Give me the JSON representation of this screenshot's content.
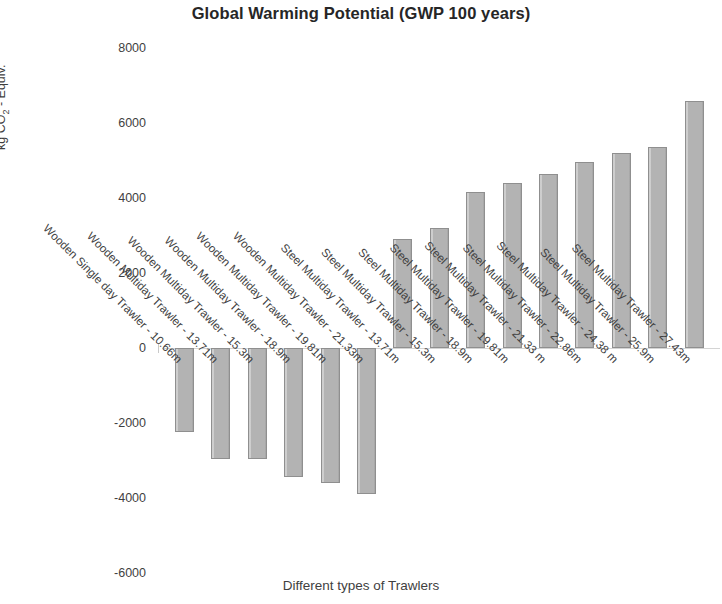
{
  "chart_data": {
    "type": "bar",
    "title": "Global Warming Potential (GWP 100 years)",
    "xlabel": "Different types of Trawlers",
    "ylabel": "kg CO2 - Equiv.",
    "ylabel_prefix": "kg CO",
    "ylabel_subscript": "2",
    "ylabel_suffix": " - Equiv.",
    "ylim": [
      -6000,
      8000
    ],
    "yticks": [
      8000,
      6000,
      4000,
      2000,
      0,
      -2000,
      -4000,
      -6000
    ],
    "ytick_labels": [
      "8000",
      "6000",
      "4000",
      "2000",
      "0",
      "-2000",
      "-4000",
      "-6000"
    ],
    "grid": false,
    "legend": "none",
    "bar_color": "#b3b3b3",
    "bar_edge_color": "#8f8f8f",
    "categories": [
      "Wooden Single day Trawler - 10.66m",
      "Wooden Multiday Trawler - 13.71m",
      "Wooden Multiday Trawler - 15.3m",
      "Wooden Multiday Trawler - 18.9m",
      "Wooden Multiday Trawler - 19.81m",
      "Wooden Multiday Trawler - 21.33m",
      "Steel Multiday Trawler - 13.71m",
      "Steel Multiday Trawler - 15.3m",
      "Steel Multiday Trawler - 18.9m",
      "Steel Multiday Trawler - 19.81m",
      "Steel Multiday Trawler - 21.33 m",
      "Steel Multiday Trawler - 22.86m",
      "Steel Multiday Trawler - 24.38 m",
      "Steel Multiday Trawler - 25.9m",
      "Steel Multiday Trawler - 27.43m"
    ],
    "values": [
      -2250,
      -2950,
      -2970,
      -3450,
      -3600,
      -3900,
      2900,
      3200,
      4150,
      4400,
      4650,
      4950,
      5200,
      5350,
      6600
    ]
  }
}
